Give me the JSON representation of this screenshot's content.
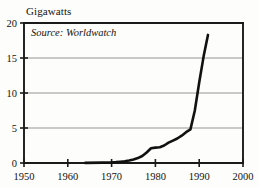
{
  "chart_data": {
    "type": "line",
    "title": "Gigawatts",
    "xlabel": "",
    "ylabel": "Gigawatts",
    "annotation": "Source: Worldwatch",
    "annotation_prefix": "Source:",
    "annotation_value": "Worldwatch",
    "xlim": [
      1950,
      2000
    ],
    "ylim": [
      0,
      20
    ],
    "xticks": [
      1950,
      1960,
      1970,
      1980,
      1990,
      2000
    ],
    "yticks": [
      0,
      5,
      10,
      15,
      20
    ],
    "xtick_labels": [
      "1950",
      "1960",
      "1970",
      "1980",
      "1990",
      "2000"
    ],
    "ytick_labels": [
      "0",
      "5",
      "10",
      "15",
      "20"
    ],
    "grid": true,
    "grid_axis": "y",
    "legend": false,
    "line_color": "#111111",
    "line_width": 2.6,
    "axis_color": "#1a1a1a",
    "grid_color": "#8a8a8a",
    "background_color": "#fdfdfb",
    "series": [
      {
        "name": "Wind electric generating capacity",
        "x": [
          1964,
          1968,
          1970,
          1971,
          1972,
          1973,
          1974,
          1975,
          1976,
          1977,
          1978,
          1979,
          1980,
          1981,
          1982,
          1983,
          1984,
          1985,
          1986,
          1987,
          1988,
          1989,
          1990,
          1991,
          1992
        ],
        "values": [
          0.02,
          0.05,
          0.08,
          0.12,
          0.18,
          0.25,
          0.35,
          0.5,
          0.7,
          1.0,
          1.5,
          2.1,
          2.2,
          2.25,
          2.5,
          2.9,
          3.2,
          3.5,
          3.9,
          4.4,
          4.8,
          7.5,
          11.5,
          15.2,
          18.3
        ]
      }
    ]
  },
  "axes": {
    "plot_left": 24,
    "plot_top": 23,
    "plot_right": 243,
    "plot_bottom": 163
  }
}
